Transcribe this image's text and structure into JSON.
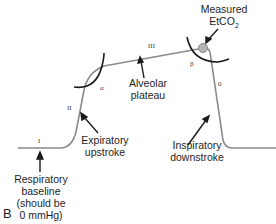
{
  "panel_label": "B",
  "labels": {
    "measured_line1": "Measured",
    "measured_line2": "EtCO",
    "measured_sub": "2",
    "alveolar_line1": "Alveolar",
    "alveolar_line2": "plateau",
    "expiratory_line1": "Expiratory",
    "expiratory_line2": "upstroke",
    "inspiratory_line1": "Inspiratory",
    "inspiratory_line2": "downstroke",
    "baseline_line1": "Respiratory",
    "baseline_line2": "baseline",
    "baseline_line3": "(should be",
    "baseline_line4": "0 mmHg)"
  },
  "phases": {
    "I": "I",
    "II": "II",
    "III": "III",
    "O": "0",
    "alpha": "α",
    "beta": "β"
  },
  "colors": {
    "waveform": "#8a8a8a",
    "angle_arc": "#1a1a1a",
    "marker_fill": "#b5b5b5",
    "text": "#1e1e1e"
  }
}
